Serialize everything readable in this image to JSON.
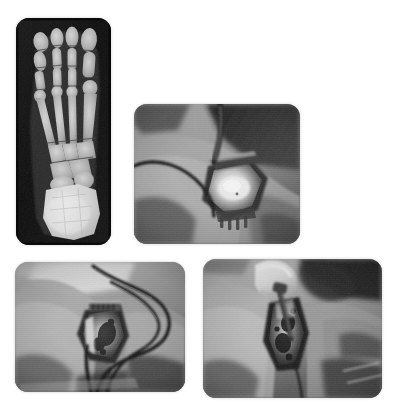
{
  "figure": {
    "modality": "Composite medical figure",
    "background_color": "#ffffff",
    "panel_count": 4,
    "color_mode": "grayscale",
    "width_px": 395,
    "height_px": 415
  },
  "panels": [
    {
      "id": "panel-xray",
      "label": "",
      "type": "radiograph",
      "view": "anteroposterior foot radiograph",
      "anatomy": "forefoot, midfoot and hindfoot",
      "description": "Dorsoplantar (AP) radiograph of a foot showing phalanges, metatarsals, tarsal bones and calcaneus with dense bright bone at the hindfoot",
      "orientation": "portrait",
      "background_color": "#0a0a0a",
      "bone_color": "#d8d8d8"
    },
    {
      "id": "panel-op1",
      "label": "",
      "type": "intraoperative-photo",
      "description": "Intraoperative photograph of an open surgical wound on the foot held apart by retractors, with a dark cable or drain crossing the field",
      "orientation": "landscape",
      "features": [
        "surgical wound",
        "retractor",
        "cable",
        "draped skin"
      ]
    },
    {
      "id": "panel-op2",
      "label": "",
      "type": "intraoperative-photo",
      "description": "Intraoperative photograph showing the surgical site with multiple looping cables or sutures running across the draped limb",
      "orientation": "landscape",
      "features": [
        "surgical site",
        "looping cables",
        "drape",
        "skin folds"
      ]
    },
    {
      "id": "panel-op3",
      "label": "",
      "type": "intraoperative-photo",
      "description": "Intraoperative photograph of a gloved hand holding an instrument above the open wound of the foot",
      "orientation": "landscape",
      "features": [
        "gloved hand",
        "instrument",
        "open wound",
        "skin"
      ]
    }
  ]
}
